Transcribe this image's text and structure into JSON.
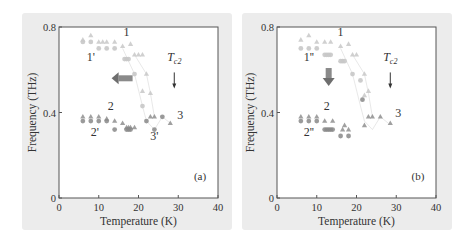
{
  "chart_data": [
    {
      "type": "scatter",
      "panel_label": "(a)",
      "xlabel": "Temperature (K)",
      "ylabel": "Frequency (THz)",
      "xlim": [
        0,
        40
      ],
      "ylim": [
        0,
        0.8
      ],
      "xticks": [
        0,
        10,
        20,
        30,
        40
      ],
      "yticks": [
        0,
        0.4,
        0.8
      ],
      "ytick_labels": [
        "0",
        "0.4",
        "0.8"
      ],
      "grid": false,
      "annotations": [
        {
          "text": "1",
          "x": 17,
          "y": 0.76
        },
        {
          "text": "1'",
          "x": 8,
          "y": 0.64
        },
        {
          "text": "2",
          "x": 13,
          "y": 0.41
        },
        {
          "text": "2'",
          "x": 9,
          "y": 0.29
        },
        {
          "text": "3",
          "x": 30.5,
          "y": 0.37
        },
        {
          "text": "3'",
          "x": 24,
          "y": 0.27
        },
        {
          "text": "Tc2",
          "x": 29,
          "y": 0.64
        },
        {
          "text": "arrow-down Tc2",
          "x": 29,
          "y": 0.55
        },
        {
          "text": "arrow-left (bold gray)",
          "x": 16,
          "y": 0.56
        }
      ],
      "series": [
        {
          "name": "triangles-upper",
          "marker": "triangle",
          "x": [
            6,
            8,
            10,
            11,
            12,
            14,
            16,
            18,
            19,
            20,
            21,
            22
          ],
          "y": [
            0.74,
            0.76,
            0.73,
            0.73,
            0.73,
            0.73,
            0.71,
            0.72,
            0.67,
            0.67,
            0.67,
            0.58
          ]
        },
        {
          "name": "circles-upper",
          "marker": "circle",
          "x": [
            6,
            8,
            10,
            12,
            14,
            16.5,
            17,
            17.5,
            19,
            21
          ],
          "y": [
            0.73,
            0.73,
            0.7,
            0.7,
            0.7,
            0.65,
            0.65,
            0.65,
            0.58,
            0.43
          ]
        },
        {
          "name": "triangles-mid",
          "marker": "triangle",
          "x": [
            21,
            23
          ],
          "y": [
            0.5,
            0.49
          ]
        },
        {
          "name": "triangles-lower",
          "marker": "triangle",
          "x": [
            6,
            8,
            10,
            12,
            14,
            16,
            17,
            17.5,
            18,
            19,
            23,
            24,
            28
          ],
          "y": [
            0.38,
            0.38,
            0.38,
            0.37,
            0.36,
            0.35,
            0.33,
            0.33,
            0.33,
            0.33,
            0.38,
            0.38,
            0.35
          ]
        },
        {
          "name": "circles-lower",
          "marker": "circle",
          "x": [
            6,
            8,
            10,
            12,
            14,
            17,
            17.5,
            18,
            22,
            24,
            26
          ],
          "y": [
            0.36,
            0.36,
            0.36,
            0.36,
            0.32,
            0.32,
            0.32,
            0.32,
            0.36,
            0.32,
            0.38
          ]
        }
      ]
    },
    {
      "type": "scatter",
      "panel_label": "(b)",
      "xlabel": "Temperature (K)",
      "ylabel": "Frequency (THz)",
      "xlim": [
        0,
        40
      ],
      "ylim": [
        0,
        0.8
      ],
      "xticks": [
        0,
        10,
        20,
        30,
        40
      ],
      "yticks": [
        0,
        0.4,
        0.8
      ],
      "ytick_labels": [
        "0",
        "0.4",
        "0.8"
      ],
      "grid": false,
      "annotations": [
        {
          "text": "1",
          "x": 16,
          "y": 0.76
        },
        {
          "text": "1''",
          "x": 8,
          "y": 0.64
        },
        {
          "text": "2",
          "x": 12.5,
          "y": 0.41
        },
        {
          "text": "2''",
          "x": 8,
          "y": 0.29
        },
        {
          "text": "3",
          "x": 30.5,
          "y": 0.38
        },
        {
          "text": "Tc2",
          "x": 28.5,
          "y": 0.64
        },
        {
          "text": "arrow-down Tc2",
          "x": 28.5,
          "y": 0.55
        },
        {
          "text": "arrow-down (bold gray)",
          "x": 13,
          "y": 0.58
        }
      ],
      "series": [
        {
          "name": "triangles-upper",
          "marker": "triangle",
          "x": [
            6,
            8,
            10,
            12,
            13.5,
            16,
            18,
            19,
            20,
            22
          ],
          "y": [
            0.74,
            0.76,
            0.73,
            0.73,
            0.73,
            0.71,
            0.72,
            0.67,
            0.67,
            0.58
          ]
        },
        {
          "name": "circles-upper",
          "marker": "circle",
          "x": [
            6,
            8,
            10,
            12,
            12.5,
            13,
            13.5,
            16,
            16.5,
            17,
            19,
            21
          ],
          "y": [
            0.7,
            0.7,
            0.7,
            0.67,
            0.67,
            0.67,
            0.67,
            0.64,
            0.64,
            0.64,
            0.58,
            0.55
          ]
        },
        {
          "name": "triangles-mid",
          "marker": "triangle",
          "x": [
            22,
            23
          ],
          "y": [
            0.48,
            0.5
          ]
        },
        {
          "name": "triangles-lower",
          "marker": "triangle",
          "x": [
            6,
            8,
            10,
            12,
            14,
            16.5,
            17,
            18,
            22,
            23,
            24,
            26,
            28.5
          ],
          "y": [
            0.38,
            0.38,
            0.38,
            0.36,
            0.36,
            0.32,
            0.34,
            0.32,
            0.34,
            0.38,
            0.38,
            0.38,
            0.35
          ]
        },
        {
          "name": "circles-lower",
          "marker": "circle",
          "x": [
            6,
            8,
            10,
            12,
            12.5,
            13,
            13.5,
            14,
            16,
            18,
            21.5
          ],
          "y": [
            0.36,
            0.36,
            0.36,
            0.32,
            0.32,
            0.32,
            0.32,
            0.32,
            0.29,
            0.29,
            0.46
          ]
        }
      ]
    }
  ],
  "colors": {
    "background_panel": "#ececec",
    "plot_area": "#ffffff",
    "axis": "#555555",
    "marker_light": "#c8c8c8",
    "marker_dark": "#888888",
    "arrow": "#8a8a8a"
  }
}
